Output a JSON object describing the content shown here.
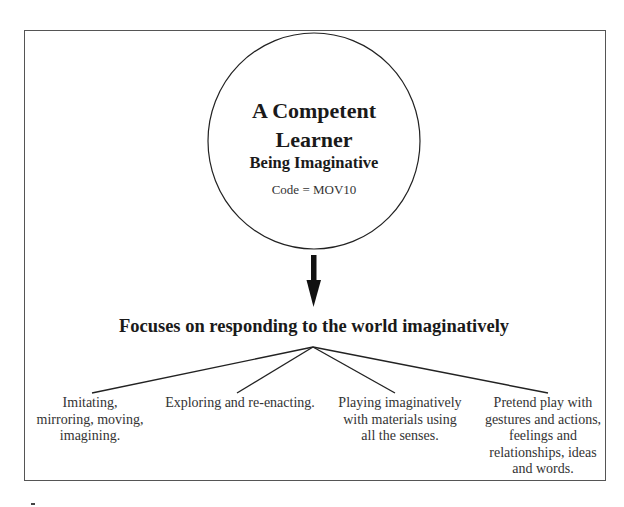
{
  "diagram": {
    "central_node": {
      "title_line1": "A Competent",
      "title_line2": "Learner",
      "subtitle": "Being Imaginative",
      "code": "Code = MOV10"
    },
    "focus_heading": "Focuses on responding to the world imaginatively",
    "branches": [
      {
        "lines": [
          "Imitating,",
          "mirroring, moving,",
          "imagining."
        ]
      },
      {
        "lines": [
          "Exploring and re-enacting."
        ]
      },
      {
        "lines": [
          "Playing imaginatively",
          "with materials using",
          "all the senses."
        ]
      },
      {
        "lines": [
          "Pretend play with",
          "gestures and actions,",
          "feelings and",
          "relationships, ideas",
          "and words."
        ]
      }
    ],
    "colors": {
      "stroke": "#222222",
      "frame": "#555555",
      "text": "#333333"
    }
  }
}
